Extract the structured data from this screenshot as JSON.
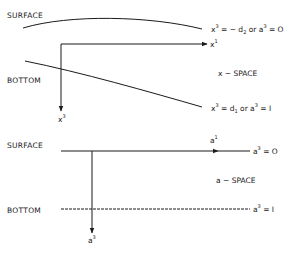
{
  "x_space": {
    "surface_label": "SURFACE",
    "bottom_label": "BOTTOM",
    "space_label": "x − SPACE",
    "axis_horizontal": {
      "base": "x",
      "sup": "1"
    },
    "axis_vertical": {
      "base": "x",
      "sup": "3"
    },
    "surface_eq": {
      "lhs_base": "x",
      "lhs_sup": "3",
      "rhs_a": " = − d",
      "rhs_a_sub": "2",
      "or": " or ",
      "rhs_b_base": "a",
      "rhs_b_sup": "3",
      "rhs_b_val": " = O"
    },
    "bottom_eq": {
      "lhs_base": "x",
      "lhs_sup": "3",
      "rhs_a": " = d",
      "rhs_a_sub": "1",
      "or": "  or ",
      "rhs_b_base": "a",
      "rhs_b_sup": "3",
      "rhs_b_val": " = I"
    }
  },
  "a_space": {
    "surface_label": "SURFACE",
    "bottom_label": "BOTTOM",
    "space_label": "a − SPACE",
    "axis_horizontal": {
      "base": "a",
      "sup": "1"
    },
    "axis_vertical": {
      "base": "a",
      "sup": "3"
    },
    "surface_eq": {
      "base": "a",
      "sup": "3",
      "val": " = O"
    },
    "bottom_eq": {
      "base": "a",
      "sup": "3",
      "val": " = I"
    }
  },
  "colors": {
    "ink": "#1a1a1a",
    "background": "#ffffff"
  }
}
